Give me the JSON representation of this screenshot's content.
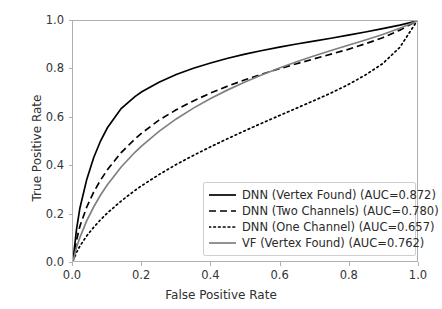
{
  "chart_data": {
    "type": "line",
    "title": "",
    "xlabel": "False Positive Rate",
    "ylabel": "True Positive Rate",
    "xlim": [
      0.0,
      1.0
    ],
    "ylim": [
      0.0,
      1.0
    ],
    "xticks": [
      "0.0",
      "0.2",
      "0.4",
      "0.6",
      "0.8",
      "1.0"
    ],
    "yticks": [
      "0.0",
      "0.2",
      "0.4",
      "0.6",
      "0.8",
      "1.0"
    ],
    "xtick_values": [
      0.0,
      0.2,
      0.4,
      0.6,
      0.8,
      1.0
    ],
    "ytick_values": [
      0.0,
      0.2,
      0.4,
      0.6,
      0.8,
      1.0
    ],
    "grid": false,
    "legend_position": "lower right",
    "series": [
      {
        "name": "DNN (Vertex Found) (AUC=0.872)",
        "label": "DNN (Vertex Found) (AUC=0.872)",
        "auc": 0.872,
        "style": "solid",
        "color": "#000000",
        "x": [
          0.0,
          0.01,
          0.02,
          0.04,
          0.06,
          0.08,
          0.1,
          0.14,
          0.18,
          0.2,
          0.25,
          0.3,
          0.35,
          0.4,
          0.45,
          0.5,
          0.55,
          0.6,
          0.65,
          0.7,
          0.75,
          0.8,
          0.85,
          0.9,
          0.95,
          1.0
        ],
        "y": [
          0.0,
          0.13,
          0.22,
          0.34,
          0.43,
          0.5,
          0.555,
          0.635,
          0.685,
          0.705,
          0.745,
          0.777,
          0.803,
          0.825,
          0.845,
          0.862,
          0.877,
          0.891,
          0.904,
          0.916,
          0.928,
          0.941,
          0.954,
          0.968,
          0.983,
          1.0
        ]
      },
      {
        "name": "DNN (Two Channels) (AUC=0.780)",
        "label": "DNN (Two Channels) (AUC=0.780)",
        "auc": 0.78,
        "style": "dashed",
        "color": "#000000",
        "x": [
          0.0,
          0.01,
          0.02,
          0.04,
          0.06,
          0.08,
          0.1,
          0.14,
          0.18,
          0.2,
          0.25,
          0.3,
          0.35,
          0.4,
          0.45,
          0.5,
          0.55,
          0.6,
          0.65,
          0.7,
          0.75,
          0.8,
          0.85,
          0.9,
          0.95,
          1.0
        ],
        "y": [
          0.0,
          0.085,
          0.145,
          0.225,
          0.287,
          0.337,
          0.38,
          0.452,
          0.508,
          0.533,
          0.587,
          0.63,
          0.667,
          0.7,
          0.729,
          0.755,
          0.779,
          0.801,
          0.822,
          0.842,
          0.862,
          0.882,
          0.905,
          0.93,
          0.962,
          1.0
        ]
      },
      {
        "name": "DNN (One Channel) (AUC=0.657)",
        "label": "DNN (One Channel) (AUC=0.657)",
        "auc": 0.657,
        "style": "dotted",
        "color": "#000000",
        "x": [
          0.0,
          0.01,
          0.02,
          0.04,
          0.06,
          0.08,
          0.1,
          0.14,
          0.18,
          0.2,
          0.25,
          0.3,
          0.35,
          0.4,
          0.45,
          0.5,
          0.55,
          0.6,
          0.65,
          0.7,
          0.75,
          0.8,
          0.85,
          0.9,
          0.95,
          1.0
        ],
        "y": [
          0.0,
          0.035,
          0.062,
          0.105,
          0.14,
          0.172,
          0.2,
          0.25,
          0.294,
          0.314,
          0.36,
          0.402,
          0.44,
          0.476,
          0.51,
          0.543,
          0.575,
          0.606,
          0.637,
          0.668,
          0.7,
          0.735,
          0.775,
          0.822,
          0.89,
          1.0
        ]
      },
      {
        "name": "VF (Vertex Found) (AUC=0.762)",
        "label": "VF (Vertex Found) (AUC=0.762)",
        "auc": 0.762,
        "style": "solid",
        "color": "#808080",
        "x": [
          0.0,
          0.01,
          0.02,
          0.04,
          0.06,
          0.08,
          0.1,
          0.14,
          0.18,
          0.2,
          0.25,
          0.3,
          0.35,
          0.4,
          0.45,
          0.5,
          0.55,
          0.6,
          0.65,
          0.7,
          0.75,
          0.8,
          0.85,
          0.9,
          0.95,
          1.0
        ],
        "y": [
          0.0,
          0.055,
          0.098,
          0.168,
          0.225,
          0.275,
          0.318,
          0.392,
          0.453,
          0.48,
          0.54,
          0.592,
          0.637,
          0.677,
          0.713,
          0.746,
          0.776,
          0.804,
          0.83,
          0.854,
          0.877,
          0.899,
          0.921,
          0.944,
          0.97,
          1.0
        ]
      }
    ]
  }
}
